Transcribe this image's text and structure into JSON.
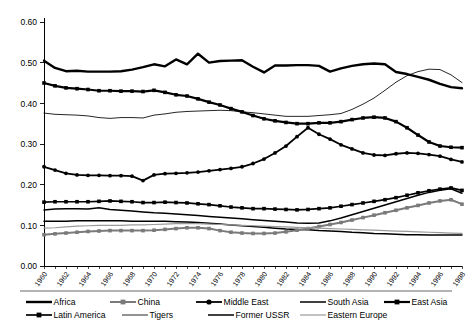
{
  "chart_data": {
    "type": "line",
    "title": "",
    "subtitle": "",
    "xlabel": "",
    "ylabel": "",
    "xlim": [
      1960,
      1998
    ],
    "ylim": [
      0.0,
      0.6
    ],
    "grid": false,
    "legend_position": "bottom",
    "y_ticks": [
      "0.00",
      "0.10",
      "0.20",
      "0.30",
      "0.40",
      "0.50",
      "0.60"
    ],
    "y_tick_values": [
      0.0,
      0.1,
      0.2,
      0.3,
      0.4,
      0.5,
      0.6
    ],
    "x": [
      1960,
      1961,
      1962,
      1963,
      1964,
      1965,
      1966,
      1967,
      1968,
      1969,
      1970,
      1971,
      1972,
      1973,
      1974,
      1975,
      1976,
      1977,
      1978,
      1979,
      1980,
      1981,
      1982,
      1983,
      1984,
      1985,
      1986,
      1987,
      1988,
      1989,
      1990,
      1991,
      1992,
      1993,
      1994,
      1995,
      1996,
      1997,
      1998
    ],
    "x_tick_labels": [
      "1960",
      "1962",
      "1964",
      "1966",
      "1968",
      "1970",
      "1972",
      "1974",
      "1976",
      "1978",
      "1980",
      "1982",
      "1984",
      "1986",
      "1988",
      "1990",
      "1992",
      "1994",
      "1996",
      "1998"
    ],
    "x_tick_values": [
      1960,
      1962,
      1964,
      1966,
      1968,
      1970,
      1972,
      1974,
      1976,
      1978,
      1980,
      1982,
      1984,
      1986,
      1988,
      1990,
      1992,
      1994,
      1996,
      1998
    ],
    "series": [
      {
        "name": "Africa",
        "color": "#000000",
        "width": 2.4,
        "marker": "none",
        "values": [
          0.505,
          0.487,
          0.479,
          0.48,
          0.478,
          0.478,
          0.478,
          0.479,
          0.483,
          0.489,
          0.496,
          0.491,
          0.508,
          0.496,
          0.522,
          0.5,
          0.504,
          0.505,
          0.506,
          0.49,
          0.476,
          0.493,
          0.493,
          0.494,
          0.494,
          0.492,
          0.478,
          0.486,
          0.492,
          0.496,
          0.498,
          0.496,
          0.477,
          0.472,
          0.465,
          0.458,
          0.448,
          0.44,
          0.437
        ]
      },
      {
        "name": "East Asia",
        "color": "#000000",
        "width": 2.2,
        "marker": "square",
        "values": [
          0.45,
          0.443,
          0.438,
          0.436,
          0.434,
          0.431,
          0.431,
          0.43,
          0.43,
          0.429,
          0.432,
          0.427,
          0.421,
          0.418,
          0.411,
          0.403,
          0.396,
          0.387,
          0.379,
          0.37,
          0.362,
          0.357,
          0.353,
          0.35,
          0.35,
          0.352,
          0.352,
          0.355,
          0.36,
          0.364,
          0.366,
          0.364,
          0.355,
          0.34,
          0.322,
          0.305,
          0.295,
          0.292,
          0.291
        ]
      },
      {
        "name": "Tigers",
        "color": "#000000",
        "width": 0.85,
        "marker": "none",
        "values": [
          0.376,
          0.373,
          0.372,
          0.371,
          0.369,
          0.365,
          0.363,
          0.365,
          0.365,
          0.364,
          0.371,
          0.374,
          0.378,
          0.38,
          0.381,
          0.382,
          0.383,
          0.382,
          0.379,
          0.377,
          0.374,
          0.371,
          0.368,
          0.368,
          0.368,
          0.37,
          0.372,
          0.375,
          0.385,
          0.398,
          0.413,
          0.432,
          0.452,
          0.468,
          0.478,
          0.484,
          0.483,
          0.47,
          0.451
        ]
      },
      {
        "name": "Middle East",
        "color": "#000000",
        "width": 1.8,
        "marker": "circle",
        "values": [
          0.244,
          0.236,
          0.228,
          0.224,
          0.223,
          0.223,
          0.222,
          0.222,
          0.221,
          0.21,
          0.224,
          0.227,
          0.228,
          0.229,
          0.231,
          0.234,
          0.237,
          0.24,
          0.244,
          0.252,
          0.263,
          0.278,
          0.295,
          0.318,
          0.34,
          0.324,
          0.312,
          0.298,
          0.288,
          0.278,
          0.273,
          0.272,
          0.276,
          0.278,
          0.277,
          0.274,
          0.27,
          0.262,
          0.256
        ]
      },
      {
        "name": "Latin America",
        "color": "#000000",
        "width": 1.7,
        "marker": "square",
        "values": [
          0.157,
          0.158,
          0.158,
          0.158,
          0.158,
          0.159,
          0.16,
          0.159,
          0.158,
          0.156,
          0.156,
          0.157,
          0.156,
          0.155,
          0.153,
          0.151,
          0.148,
          0.145,
          0.143,
          0.141,
          0.141,
          0.14,
          0.139,
          0.138,
          0.139,
          0.141,
          0.143,
          0.147,
          0.151,
          0.155,
          0.159,
          0.163,
          0.168,
          0.174,
          0.18,
          0.185,
          0.189,
          0.192,
          0.186
        ]
      },
      {
        "name": "South Asia",
        "color": "#000000",
        "width": 1.5,
        "marker": "none",
        "values": [
          0.138,
          0.14,
          0.141,
          0.141,
          0.14,
          0.143,
          0.139,
          0.137,
          0.135,
          0.133,
          0.131,
          0.13,
          0.128,
          0.126,
          0.124,
          0.122,
          0.12,
          0.118,
          0.116,
          0.114,
          0.112,
          0.11,
          0.108,
          0.106,
          0.105,
          0.106,
          0.111,
          0.118,
          0.126,
          0.134,
          0.142,
          0.15,
          0.158,
          0.166,
          0.174,
          0.181,
          0.186,
          0.19,
          0.179
        ]
      },
      {
        "name": "Former USSR",
        "color": "#000000",
        "width": 1.5,
        "marker": "none",
        "values": [
          0.11,
          0.11,
          0.11,
          0.111,
          0.111,
          0.111,
          0.111,
          0.111,
          0.11,
          0.11,
          0.11,
          0.11,
          0.109,
          0.108,
          0.107,
          0.105,
          0.103,
          0.101,
          0.099,
          0.097,
          0.095,
          0.093,
          0.091,
          0.09,
          0.089,
          0.087,
          0.086,
          0.085,
          0.083,
          0.082,
          0.08,
          0.079,
          0.078,
          0.077,
          0.077,
          0.076,
          0.076,
          0.076,
          0.076
        ]
      },
      {
        "name": "China",
        "color": "#7a7a7a",
        "width": 2.0,
        "marker": "square",
        "values": [
          0.077,
          0.079,
          0.081,
          0.083,
          0.085,
          0.086,
          0.087,
          0.087,
          0.087,
          0.087,
          0.088,
          0.09,
          0.092,
          0.094,
          0.094,
          0.092,
          0.087,
          0.083,
          0.081,
          0.08,
          0.08,
          0.081,
          0.084,
          0.088,
          0.092,
          0.097,
          0.102,
          0.107,
          0.113,
          0.119,
          0.125,
          0.131,
          0.137,
          0.143,
          0.149,
          0.155,
          0.16,
          0.163,
          0.152
        ]
      },
      {
        "name": "Eastern Europe",
        "color": "#9a9a9a",
        "width": 1.2,
        "marker": "none",
        "values": [
          0.093,
          0.094,
          0.096,
          0.098,
          0.099,
          0.1,
          0.1,
          0.1,
          0.101,
          0.101,
          0.102,
          0.103,
          0.104,
          0.104,
          0.104,
          0.103,
          0.102,
          0.101,
          0.1,
          0.099,
          0.098,
          0.097,
          0.096,
          0.095,
          0.094,
          0.093,
          0.092,
          0.091,
          0.09,
          0.089,
          0.088,
          0.087,
          0.086,
          0.085,
          0.084,
          0.083,
          0.082,
          0.081,
          0.08
        ]
      }
    ]
  },
  "legend": {
    "row1": [
      {
        "label": "Africa",
        "key": "Africa"
      },
      {
        "label": "China",
        "key": "China"
      },
      {
        "label": "Middle East",
        "key": "Middle East"
      },
      {
        "label": "South Asia",
        "key": "South Asia"
      },
      {
        "label": "East Asia",
        "key": "East Asia"
      }
    ],
    "row2": [
      {
        "label": "Latin America",
        "key": "Latin America"
      },
      {
        "label": "Tigers",
        "key": "Tigers"
      },
      {
        "label": "Former USSR",
        "key": "Former USSR"
      },
      {
        "label": "Eastern Europe",
        "key": "Eastern Europe"
      }
    ]
  }
}
